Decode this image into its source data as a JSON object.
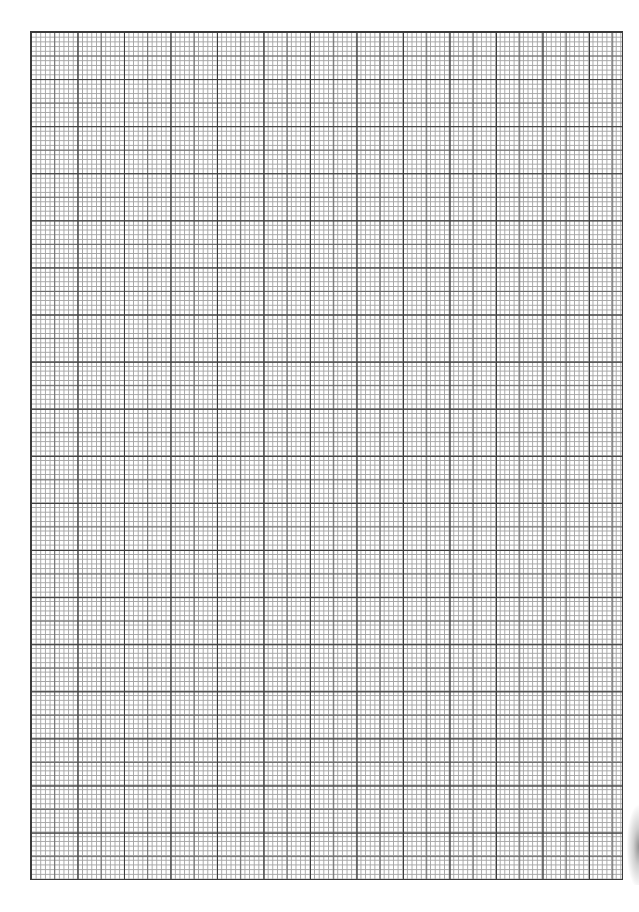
{
  "document": {
    "type": "graph-paper",
    "description": "Blank millimeter graph paper sheet",
    "grid": {
      "major_columns": 12.75,
      "major_rows": 18,
      "subdivisions_per_major": 10,
      "line_colors": {
        "major": "#3c3c3c",
        "half": "#6a6a6a",
        "fine": "#a4a4a4"
      },
      "background": "#ffffff"
    },
    "text_content": ""
  }
}
